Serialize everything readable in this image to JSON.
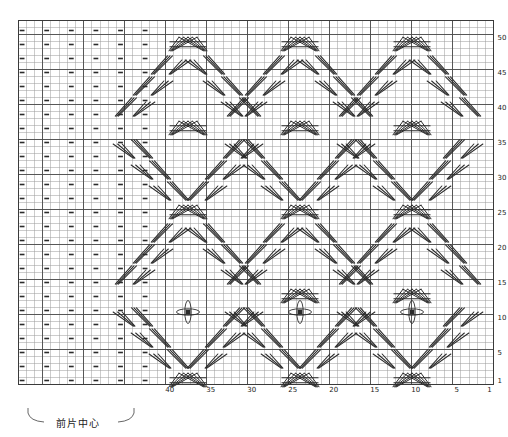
{
  "chart_data": {
    "type": "table",
    "title": "",
    "grid": {
      "columns": 58,
      "rows": 52,
      "cell_width": 8.2,
      "cell_height": 7.0,
      "origin_x": 18,
      "origin_y": 20,
      "grid_on": true,
      "heavy_line_every_col": 5,
      "heavy_line_every_row": 5,
      "grid_color": "#9a9a9a",
      "heavy_color": "#4a4a4a",
      "symbol_color": "#2b2b2b"
    },
    "axes": {
      "bottom": {
        "label": "",
        "direction": "right-to-left",
        "ticks": [
          1,
          5,
          10,
          15,
          20,
          25,
          30,
          35,
          40
        ],
        "tick_columns_from_right": [
          1,
          5,
          10,
          15,
          20,
          25,
          30,
          35,
          40
        ]
      },
      "right": {
        "label": "",
        "direction": "bottom-to-top",
        "ticks": [
          1,
          5,
          10,
          15,
          20,
          25,
          30,
          35,
          40,
          45,
          50
        ]
      }
    },
    "annotations": [
      {
        "name": "front-center-bracket",
        "text": "前片中心",
        "x": 82,
        "y": 422,
        "bracket_left": 28,
        "bracket_right": 134,
        "bracket_top": 408
      }
    ],
    "legend": {
      "position": "none",
      "entries": [
        {
          "symbol": "dash",
          "meaning": "purl stitch"
        },
        {
          "symbol": "cross",
          "meaning": "cable cross"
        },
        {
          "symbol": "bobble",
          "meaning": "bobble / nupp"
        }
      ]
    },
    "purl_field": {
      "col_start": 0,
      "col_end": 16,
      "col_step": 3,
      "row_start": 1,
      "row_end": 51,
      "row_step": 2,
      "note": "dashes mark purl columns in the left plain panel"
    },
    "bobbles": [
      {
        "col_from_left": 20,
        "row_from_bottom": 13,
        "x": 188,
        "y": 312
      },
      {
        "col_from_left": 34,
        "row_from_bottom": 13,
        "x": 300,
        "y": 312
      },
      {
        "col_from_left": 48,
        "row_from_bottom": 13,
        "x": 412,
        "y": 312
      }
    ],
    "cable_units": [
      {
        "x": 188,
        "y": 44,
        "kind": "double-cross"
      },
      {
        "x": 300,
        "y": 44,
        "kind": "double-cross"
      },
      {
        "x": 412,
        "y": 44,
        "kind": "double-cross"
      },
      {
        "x": 170,
        "y": 65,
        "kind": "right-cross"
      },
      {
        "x": 206,
        "y": 65,
        "kind": "left-cross"
      },
      {
        "x": 282,
        "y": 65,
        "kind": "right-cross"
      },
      {
        "x": 318,
        "y": 65,
        "kind": "left-cross"
      },
      {
        "x": 394,
        "y": 65,
        "kind": "right-cross"
      },
      {
        "x": 430,
        "y": 65,
        "kind": "left-cross"
      },
      {
        "x": 152,
        "y": 86,
        "kind": "right-cross"
      },
      {
        "x": 224,
        "y": 86,
        "kind": "left-cross"
      },
      {
        "x": 264,
        "y": 86,
        "kind": "right-cross"
      },
      {
        "x": 336,
        "y": 86,
        "kind": "left-cross"
      },
      {
        "x": 376,
        "y": 86,
        "kind": "right-cross"
      },
      {
        "x": 448,
        "y": 86,
        "kind": "left-cross"
      },
      {
        "x": 134,
        "y": 107,
        "kind": "right-cross"
      },
      {
        "x": 242,
        "y": 107,
        "kind": "left-cross"
      },
      {
        "x": 246,
        "y": 107,
        "kind": "right-cross"
      },
      {
        "x": 354,
        "y": 107,
        "kind": "left-cross"
      },
      {
        "x": 358,
        "y": 107,
        "kind": "right-cross"
      },
      {
        "x": 462,
        "y": 107,
        "kind": "left-cross"
      },
      {
        "x": 300,
        "y": 128,
        "kind": "double-cross"
      },
      {
        "x": 412,
        "y": 128,
        "kind": "double-cross"
      },
      {
        "x": 188,
        "y": 128,
        "kind": "double-cross"
      },
      {
        "x": 134,
        "y": 149,
        "kind": "left-cross"
      },
      {
        "x": 242,
        "y": 149,
        "kind": "right-cross"
      },
      {
        "x": 246,
        "y": 149,
        "kind": "left-cross"
      },
      {
        "x": 354,
        "y": 149,
        "kind": "right-cross"
      },
      {
        "x": 358,
        "y": 149,
        "kind": "left-cross"
      },
      {
        "x": 462,
        "y": 149,
        "kind": "right-cross"
      },
      {
        "x": 152,
        "y": 170,
        "kind": "left-cross"
      },
      {
        "x": 224,
        "y": 170,
        "kind": "right-cross"
      },
      {
        "x": 264,
        "y": 170,
        "kind": "left-cross"
      },
      {
        "x": 336,
        "y": 170,
        "kind": "right-cross"
      },
      {
        "x": 376,
        "y": 170,
        "kind": "left-cross"
      },
      {
        "x": 448,
        "y": 170,
        "kind": "right-cross"
      },
      {
        "x": 170,
        "y": 191,
        "kind": "left-cross"
      },
      {
        "x": 206,
        "y": 191,
        "kind": "right-cross"
      },
      {
        "x": 282,
        "y": 191,
        "kind": "left-cross"
      },
      {
        "x": 318,
        "y": 191,
        "kind": "right-cross"
      },
      {
        "x": 394,
        "y": 191,
        "kind": "left-cross"
      },
      {
        "x": 430,
        "y": 191,
        "kind": "right-cross"
      },
      {
        "x": 188,
        "y": 212,
        "kind": "double-cross"
      },
      {
        "x": 300,
        "y": 212,
        "kind": "double-cross"
      },
      {
        "x": 412,
        "y": 212,
        "kind": "double-cross"
      },
      {
        "x": 170,
        "y": 233,
        "kind": "right-cross"
      },
      {
        "x": 206,
        "y": 233,
        "kind": "left-cross"
      },
      {
        "x": 282,
        "y": 233,
        "kind": "right-cross"
      },
      {
        "x": 318,
        "y": 233,
        "kind": "left-cross"
      },
      {
        "x": 394,
        "y": 233,
        "kind": "right-cross"
      },
      {
        "x": 430,
        "y": 233,
        "kind": "left-cross"
      },
      {
        "x": 152,
        "y": 254,
        "kind": "right-cross"
      },
      {
        "x": 224,
        "y": 254,
        "kind": "left-cross"
      },
      {
        "x": 264,
        "y": 254,
        "kind": "right-cross"
      },
      {
        "x": 336,
        "y": 254,
        "kind": "left-cross"
      },
      {
        "x": 376,
        "y": 254,
        "kind": "right-cross"
      },
      {
        "x": 448,
        "y": 254,
        "kind": "left-cross"
      },
      {
        "x": 134,
        "y": 275,
        "kind": "right-cross"
      },
      {
        "x": 242,
        "y": 275,
        "kind": "left-cross"
      },
      {
        "x": 246,
        "y": 275,
        "kind": "right-cross"
      },
      {
        "x": 354,
        "y": 275,
        "kind": "left-cross"
      },
      {
        "x": 358,
        "y": 275,
        "kind": "right-cross"
      },
      {
        "x": 462,
        "y": 275,
        "kind": "left-cross"
      },
      {
        "x": 300,
        "y": 296,
        "kind": "double-cross"
      },
      {
        "x": 412,
        "y": 296,
        "kind": "double-cross"
      },
      {
        "x": 242,
        "y": 317,
        "kind": "right-cross"
      },
      {
        "x": 246,
        "y": 317,
        "kind": "left-cross"
      },
      {
        "x": 354,
        "y": 317,
        "kind": "right-cross"
      },
      {
        "x": 358,
        "y": 317,
        "kind": "left-cross"
      },
      {
        "x": 462,
        "y": 317,
        "kind": "right-cross"
      },
      {
        "x": 134,
        "y": 317,
        "kind": "left-cross"
      },
      {
        "x": 152,
        "y": 338,
        "kind": "left-cross"
      },
      {
        "x": 224,
        "y": 338,
        "kind": "right-cross"
      },
      {
        "x": 264,
        "y": 338,
        "kind": "left-cross"
      },
      {
        "x": 336,
        "y": 338,
        "kind": "right-cross"
      },
      {
        "x": 376,
        "y": 338,
        "kind": "left-cross"
      },
      {
        "x": 448,
        "y": 338,
        "kind": "right-cross"
      },
      {
        "x": 170,
        "y": 359,
        "kind": "left-cross"
      },
      {
        "x": 206,
        "y": 359,
        "kind": "right-cross"
      },
      {
        "x": 282,
        "y": 359,
        "kind": "left-cross"
      },
      {
        "x": 318,
        "y": 359,
        "kind": "right-cross"
      },
      {
        "x": 394,
        "y": 359,
        "kind": "left-cross"
      },
      {
        "x": 430,
        "y": 359,
        "kind": "right-cross"
      },
      {
        "x": 188,
        "y": 380,
        "kind": "double-cross"
      },
      {
        "x": 300,
        "y": 380,
        "kind": "double-cross"
      },
      {
        "x": 412,
        "y": 380,
        "kind": "double-cross"
      }
    ]
  }
}
